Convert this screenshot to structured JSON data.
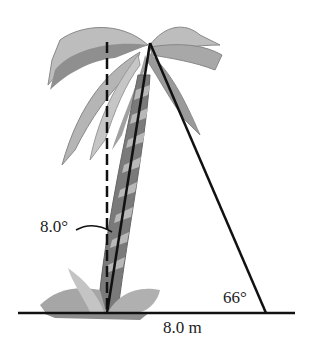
{
  "figure": {
    "labels": {
      "lean_angle": "8.0°",
      "elevation_angle": "66°",
      "distance": "8.0 m"
    },
    "elements": [
      "palm-tree",
      "vertical-dashed-reference",
      "ground-line",
      "tree-line",
      "sight-line"
    ],
    "colors": {
      "line": "#111111",
      "foliage_light": "#bdbdbd",
      "foliage_dark": "#8a8a8a",
      "trunk_dark": "#6e6e6e",
      "trunk_light": "#b0b0b0"
    }
  }
}
